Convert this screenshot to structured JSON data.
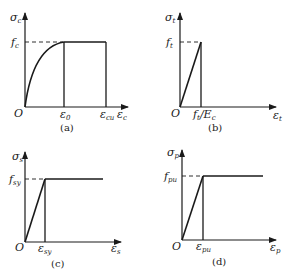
{
  "panels": [
    {
      "id": "a",
      "caption": "(a)",
      "y_axis": {
        "symbol": "σ",
        "subscript": "c"
      },
      "x_axis": {
        "symbol": "ε",
        "subscript": "c"
      },
      "origin": "O",
      "y_marks": [
        {
          "symbol": "f",
          "subscript": "c"
        }
      ],
      "x_marks": [
        {
          "symbol": "ε",
          "subscript": "0"
        },
        {
          "symbol": "ε",
          "subscript": "cu"
        }
      ],
      "curve": "parabolic rise to f_c at ε_0, then constant plateau to ε_cu"
    },
    {
      "id": "b",
      "caption": "(b)",
      "y_axis": {
        "symbol": "σ",
        "subscript": "t"
      },
      "x_axis": {
        "symbol": "ε",
        "subscript": "t"
      },
      "origin": "O",
      "y_marks": [
        {
          "symbol": "f",
          "subscript": "t"
        }
      ],
      "x_marks": [
        {
          "symbol": "f",
          "subscript": "t",
          "suffix": "/E",
          "suffix_sub": "c"
        }
      ],
      "curve": "linear rise to f_t at f_t/E_c, then vertical drop"
    },
    {
      "id": "c",
      "caption": "(c)",
      "y_axis": {
        "symbol": "σ",
        "subscript": "s"
      },
      "x_axis": {
        "symbol": "ε",
        "subscript": "s"
      },
      "origin": "O",
      "y_marks": [
        {
          "symbol": "f",
          "subscript": "sy"
        }
      ],
      "x_marks": [
        {
          "symbol": "ε",
          "subscript": "sy"
        }
      ],
      "curve": "linear rise to f_sy at ε_sy, then horizontal plateau"
    },
    {
      "id": "d",
      "caption": "(d)",
      "y_axis": {
        "symbol": "σ",
        "subscript": "p"
      },
      "x_axis": {
        "symbol": "ε",
        "subscript": "p"
      },
      "origin": "O",
      "y_marks": [
        {
          "symbol": "f",
          "subscript": "pu"
        }
      ],
      "x_marks": [
        {
          "symbol": "ε",
          "subscript": "pu"
        }
      ],
      "curve": "linear rise to f_pu at ε_pu, then horizontal plateau"
    }
  ],
  "colors": {
    "line": "#1a1a1a",
    "background": "#ffffff"
  }
}
